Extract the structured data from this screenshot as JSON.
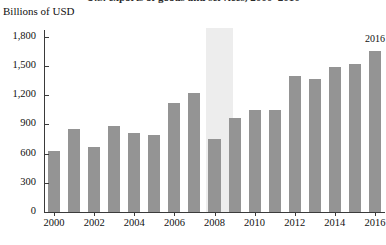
{
  "chart_data": {
    "type": "bar",
    "title": "U.S. exports of goods and services, 2000–2016",
    "subtitle": "",
    "ylabel": "Billions of USD",
    "xlabel": "",
    "ylim": [
      0,
      1900
    ],
    "yticks": [
      0,
      300,
      600,
      900,
      1200,
      1500,
      1800
    ],
    "ytick_labels": [
      "0",
      "300",
      "600",
      "900",
      "1,200",
      "1,500",
      "1,800"
    ],
    "grid": false,
    "legend": "none",
    "categories": [
      "2000",
      "2001",
      "2002",
      "2003",
      "2004",
      "2005",
      "2006",
      "2007",
      "2008",
      "2009",
      "2010",
      "2011",
      "2012",
      "2013",
      "2014",
      "2015",
      "2016"
    ],
    "xtick_labels": [
      "2000",
      "2002",
      "2004",
      "2006",
      "2008",
      "2010",
      "2012",
      "2014",
      "2016"
    ],
    "values": [
      630,
      850,
      670,
      880,
      810,
      790,
      1120,
      1220,
      750,
      970,
      1050,
      1045,
      1400,
      1370,
      1490,
      1520,
      1650
    ],
    "bar_color": "#949494",
    "annotations": [
      {
        "text": "2016",
        "category": "2016",
        "value": 1650
      }
    ],
    "shaded_regions": [
      {
        "label": "recession-band",
        "from": "2008",
        "to": "2008",
        "color": "#ededed"
      }
    ]
  }
}
